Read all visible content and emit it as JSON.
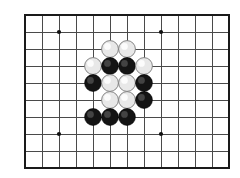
{
  "diagram": {
    "board": {
      "type": "go-goban-section",
      "origin_x": 25,
      "origin_y": 15,
      "cell": 17.0,
      "cols": 12,
      "rows": 9,
      "line_color": "#4a4a4a",
      "border_color": "#1a1a1a",
      "background_color": "#ffffff"
    },
    "star_points": [
      {
        "name": "hoshi-top-left",
        "col": 2,
        "row": 1
      },
      {
        "name": "hoshi-top-right",
        "col": 8,
        "row": 1
      },
      {
        "name": "hoshi-bottom-left",
        "col": 2,
        "row": 7
      },
      {
        "name": "hoshi-bottom-right",
        "col": 8,
        "row": 7
      }
    ],
    "stone_colors": {
      "black": "#141414",
      "white": "#e8e8e8",
      "white_edge": "#7a7a7a"
    },
    "stone_radius": 8.4,
    "stones": [
      {
        "id": "w1",
        "color": "white",
        "col": 5,
        "row": 2
      },
      {
        "id": "w2",
        "color": "white",
        "col": 6,
        "row": 2
      },
      {
        "id": "w3",
        "color": "white",
        "col": 4,
        "row": 3
      },
      {
        "id": "b1",
        "color": "black",
        "col": 5,
        "row": 3
      },
      {
        "id": "b2",
        "color": "black",
        "col": 6,
        "row": 3
      },
      {
        "id": "w4",
        "color": "white",
        "col": 7,
        "row": 3
      },
      {
        "id": "b3",
        "color": "black",
        "col": 4,
        "row": 4
      },
      {
        "id": "w5",
        "color": "white",
        "col": 5,
        "row": 4
      },
      {
        "id": "w6",
        "color": "white",
        "col": 6,
        "row": 4
      },
      {
        "id": "b4",
        "color": "black",
        "col": 7,
        "row": 4
      },
      {
        "id": "w7",
        "color": "white",
        "col": 5,
        "row": 5
      },
      {
        "id": "w8",
        "color": "white",
        "col": 6,
        "row": 5
      },
      {
        "id": "b5",
        "color": "black",
        "col": 7,
        "row": 5
      },
      {
        "id": "b6",
        "color": "black",
        "col": 4,
        "row": 6
      },
      {
        "id": "b7",
        "color": "black",
        "col": 5,
        "row": 6
      },
      {
        "id": "b8",
        "color": "black",
        "col": 6,
        "row": 6
      }
    ],
    "counts": {
      "black_stones": 8,
      "white_stones": 8,
      "total_stones": 16
    }
  }
}
